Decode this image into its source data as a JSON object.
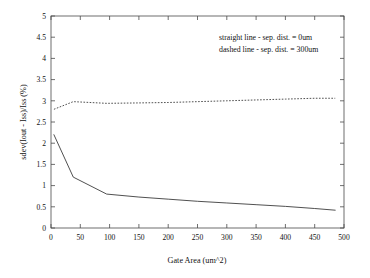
{
  "chart_data": {
    "type": "line",
    "title": "",
    "xlabel": "Gate Area (um^2)",
    "ylabel": "sdev(Iout - Iss)/Iss (%)",
    "xlim": [
      0,
      500
    ],
    "ylim": [
      0,
      5
    ],
    "grid": false,
    "legend_position": "none",
    "xticks": [
      0,
      50,
      100,
      150,
      200,
      250,
      300,
      350,
      400,
      450,
      500
    ],
    "xtick_labels": [
      "0",
      "50",
      "100",
      "150",
      "200",
      "250",
      "300",
      "350",
      "400",
      "450",
      "500"
    ],
    "yticks": [
      0,
      0.5,
      1,
      1.5,
      2,
      2.5,
      3,
      3.5,
      4,
      4.5,
      5
    ],
    "ytick_labels": [
      "0",
      "0.5",
      "1",
      "1.5",
      "2",
      "2.5",
      "3",
      "3.5",
      "4",
      "4.5",
      "5"
    ],
    "annotations": [
      "straight line - sep. dist. = 0um",
      "dashed line - sep. dist. = 300um"
    ],
    "series": [
      {
        "name": "sep. dist. = 0um",
        "style": "solid",
        "color": "#3c3c3c",
        "x": [
          5,
          38,
          95,
          150,
          200,
          250,
          300,
          350,
          400,
          450,
          485
        ],
        "values": [
          2.2,
          1.2,
          0.8,
          0.73,
          0.68,
          0.63,
          0.59,
          0.55,
          0.51,
          0.46,
          0.42
        ]
      },
      {
        "name": "sep. dist. = 300um",
        "style": "dashed",
        "color": "#3c3c3c",
        "x": [
          5,
          38,
          95,
          150,
          200,
          250,
          300,
          350,
          400,
          450,
          485
        ],
        "values": [
          2.8,
          2.98,
          2.94,
          2.95,
          2.96,
          2.98,
          3.0,
          3.02,
          3.04,
          3.06,
          3.06
        ]
      }
    ]
  },
  "axis_titles": {
    "x": "Gate Area (um^2)",
    "y": "sdev(Iout - Iss)/Iss (%)"
  },
  "annotation_block": {
    "line1": "straight line - sep. dist. = 0um",
    "line2": "dashed line - sep. dist. = 300um"
  }
}
